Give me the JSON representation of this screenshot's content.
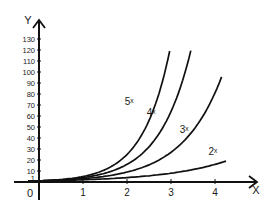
{
  "chart_data": {
    "type": "line",
    "title": "",
    "xlabel": "X",
    "ylabel": "Y",
    "origin_label": "0",
    "xlim": [
      0,
      4.9
    ],
    "ylim": [
      0,
      135
    ],
    "grid": false,
    "legend": "inline labels on curves",
    "x_ticks": [
      1,
      2,
      3,
      4
    ],
    "x_tick_labels": [
      "1",
      "2",
      "3",
      "4"
    ],
    "y_ticks": [
      1,
      10,
      20,
      30,
      40,
      50,
      60,
      70,
      80,
      90,
      100,
      110,
      120,
      130
    ],
    "y_tick_labels": [
      "1",
      "10",
      "20",
      "30",
      "40",
      "50",
      "60",
      "70",
      "80",
      "90",
      "100",
      "110",
      "120",
      "130"
    ],
    "series": [
      {
        "name": "2ˣ",
        "base": 2,
        "x_end": 4.25,
        "points": [
          [
            0,
            1
          ],
          [
            1,
            2
          ],
          [
            2,
            4
          ],
          [
            3,
            8
          ],
          [
            4,
            16
          ],
          [
            4.25,
            19
          ]
        ]
      },
      {
        "name": "3ˣ",
        "base": 3,
        "x_end": 4.15,
        "points": [
          [
            0,
            1
          ],
          [
            1,
            3
          ],
          [
            2,
            9
          ],
          [
            3,
            27
          ],
          [
            4,
            81
          ],
          [
            4.15,
            96
          ]
        ]
      },
      {
        "name": "4ˣ",
        "base": 4,
        "x_end": 3.45,
        "points": [
          [
            0,
            1
          ],
          [
            1,
            4
          ],
          [
            2,
            16
          ],
          [
            3,
            64
          ],
          [
            3.45,
            120
          ]
        ]
      },
      {
        "name": "5ˣ",
        "base": 5,
        "x_end": 2.97,
        "points": [
          [
            0,
            1
          ],
          [
            1,
            5
          ],
          [
            2,
            25
          ],
          [
            2.97,
            119
          ]
        ]
      }
    ],
    "annotations": [
      {
        "text": "5ˣ",
        "x": 2.05,
        "y": 70
      },
      {
        "text": "4ˣ",
        "x": 2.55,
        "y": 60
      },
      {
        "text": "3ˣ",
        "x": 3.3,
        "y": 45
      },
      {
        "text": "2ˣ",
        "x": 3.95,
        "y": 25
      }
    ]
  }
}
